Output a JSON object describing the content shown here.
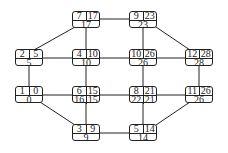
{
  "nodes": [
    {
      "id": "n7",
      "es": "7",
      "ef": "17",
      "ls": "17",
      "x": 72,
      "y": 11
    },
    {
      "id": "n9",
      "es": "9",
      "ef": "23",
      "ls": "23",
      "x": 129,
      "y": 11
    },
    {
      "id": "n2",
      "es": "2",
      "ef": "5",
      "ls": "5",
      "x": 15,
      "y": 49
    },
    {
      "id": "n4",
      "es": "4",
      "ef": "10",
      "ls": "10",
      "x": 72,
      "y": 49
    },
    {
      "id": "n10",
      "es": "10",
      "ef": "26",
      "ls": "26",
      "x": 129,
      "y": 49
    },
    {
      "id": "n12",
      "es": "12",
      "ef": "28",
      "ls": "28",
      "x": 185,
      "y": 49
    },
    {
      "id": "n1",
      "es": "1",
      "ef": "0",
      "ls": "0",
      "x": 15,
      "y": 86
    },
    {
      "id": "n6",
      "es": "6",
      "ef": "15",
      "ls": "16",
      "ls2": "15",
      "x": 72,
      "y": 86
    },
    {
      "id": "n8",
      "es": "8",
      "ef": "21",
      "ls": "22",
      "ls2": "21",
      "x": 129,
      "y": 86
    },
    {
      "id": "n11",
      "es": "11",
      "ef": "26",
      "ls": "26",
      "x": 185,
      "y": 86
    },
    {
      "id": "n3",
      "es": "3",
      "ef": "9",
      "ls": "9",
      "x": 72,
      "y": 124
    },
    {
      "id": "n5",
      "es": "5",
      "ef": "14",
      "ls": "14",
      "x": 129,
      "y": 124
    }
  ],
  "edges": [
    [
      "n7",
      "n9"
    ],
    [
      "n7",
      "n2"
    ],
    [
      "n7",
      "n4"
    ],
    [
      "n9",
      "n10"
    ],
    [
      "n9",
      "n12"
    ],
    [
      "n2",
      "n4"
    ],
    [
      "n4",
      "n10"
    ],
    [
      "n10",
      "n12"
    ],
    [
      "n2",
      "n1"
    ],
    [
      "n4",
      "n6"
    ],
    [
      "n10",
      "n8"
    ],
    [
      "n12",
      "n11"
    ],
    [
      "n1",
      "n6"
    ],
    [
      "n6",
      "n8"
    ],
    [
      "n8",
      "n11"
    ],
    [
      "n1",
      "n3"
    ],
    [
      "n6",
      "n3"
    ],
    [
      "n8",
      "n5"
    ],
    [
      "n11",
      "n5"
    ],
    [
      "n3",
      "n5"
    ]
  ]
}
